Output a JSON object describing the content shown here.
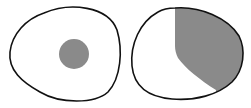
{
  "diagram": {
    "panels": [
      {
        "name": "left-cell",
        "shape": "egg-outline",
        "feature": "central-circle"
      },
      {
        "name": "right-cell",
        "shape": "egg-outline",
        "feature": "shaded-right-region"
      }
    ],
    "colors": {
      "outline": "#111111",
      "fill": "#8a8a8a",
      "background": "#ffffff"
    }
  }
}
